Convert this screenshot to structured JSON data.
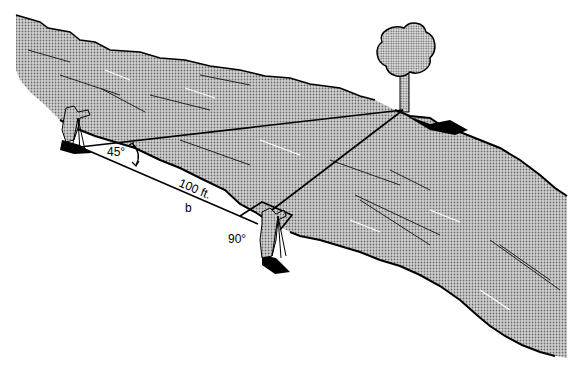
{
  "diagram": {
    "labels": {
      "angle_left": "45°",
      "angle_right": "90°",
      "distance": "100 ft.",
      "side": "b"
    },
    "elements": {
      "river": "river",
      "tree": "tree",
      "surveyor_left": "surveyor-left",
      "surveyor_right": "surveyor-right"
    },
    "colors": {
      "river_fill": "#b8b8b8",
      "ink": "#000000",
      "background": "#ffffff"
    }
  }
}
